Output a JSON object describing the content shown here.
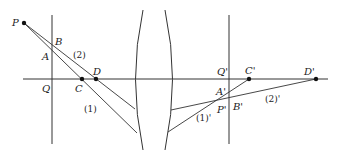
{
  "diagram": {
    "type": "optics-lens-ray-diagram",
    "labels": {
      "P": "P",
      "B": "B",
      "A": "A",
      "Q": "Q",
      "C": "C",
      "D": "D",
      "ray2": "(2)",
      "ray1": "(1)",
      "Qp": "Q'",
      "Cp": "C'",
      "Dp": "D'",
      "Ap": "A'",
      "Bp": "B'",
      "Pp": "P'",
      "ray2p": "(2)'",
      "ray1p": "(1)'"
    },
    "colors": {
      "line": "#333333",
      "point": "#111111",
      "background": "#ffffff"
    }
  }
}
